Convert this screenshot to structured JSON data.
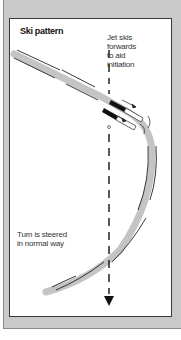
{
  "figure": {
    "title": "Ski pattern",
    "annotations": {
      "jet": [
        "Jet skis",
        "forwards",
        "to aid",
        "initiation"
      ],
      "turn": [
        "Turn is steered",
        "in normal way"
      ]
    },
    "colors": {
      "panel_background": "#c9c9c9",
      "box_background": "#ffffff",
      "ski_track": "#c4c4c4",
      "ski_edge": "#222222",
      "fall_line": "#111111"
    },
    "icons": {
      "fall_line_arrow": "arrow-down",
      "jet_arrows": "arrow-right"
    }
  }
}
